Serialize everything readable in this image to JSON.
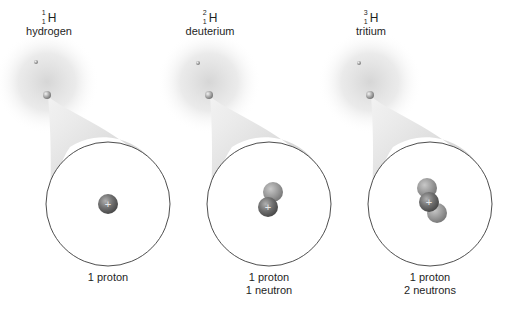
{
  "figure": {
    "isotopes": [
      {
        "mass_number": "1",
        "atomic_number": "1",
        "element_symbol": "H",
        "name": "hydrogen",
        "nucleus_caption_line1": "1 proton",
        "nucleus_caption_line2": "",
        "protons": 1,
        "neutrons": 0
      },
      {
        "mass_number": "2",
        "atomic_number": "1",
        "element_symbol": "H",
        "name": "deuterium",
        "nucleus_caption_line1": "1 proton",
        "nucleus_caption_line2": "1 neutron",
        "protons": 1,
        "neutrons": 1
      },
      {
        "mass_number": "3",
        "atomic_number": "1",
        "element_symbol": "H",
        "name": "tritium",
        "nucleus_caption_line1": "1 proton",
        "nucleus_caption_line2": "2 neutrons",
        "protons": 1,
        "neutrons": 2
      }
    ],
    "proton_sign": "+",
    "colors": {
      "electron_cloud": "#d9d9d9",
      "zoom_cone": "#cfcfcf",
      "circle_stroke": "#3a3a3a",
      "proton": "#6e6e6e",
      "neutron": "#9a9a9a",
      "text": "#1e1e1e"
    }
  }
}
